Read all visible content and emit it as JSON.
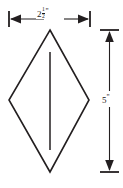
{
  "diagram": {
    "shape_name": "rhombus",
    "line_color": "#231f20",
    "background_color": "#ffffff",
    "width_dimension": {
      "whole": "2",
      "numerator": "1",
      "denominator": "2",
      "unit_mark": "\"",
      "full_text": "2 1/2\"",
      "orientation": "horizontal",
      "position": "top"
    },
    "height_dimension": {
      "value": "5",
      "unit_mark": "\"",
      "full_text": "5\"",
      "orientation": "vertical",
      "position": "right"
    },
    "center_line": {
      "label": "vertical-center-line",
      "orientation": "vertical"
    },
    "vertices": {
      "top": "50,30",
      "right": "89,100",
      "bottom": "50,172",
      "left": "9,100"
    }
  }
}
